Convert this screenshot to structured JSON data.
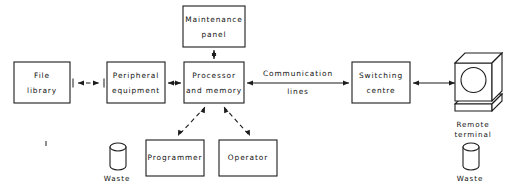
{
  "diagram": {
    "stroke_color": "#1c1c1c",
    "background_color": "#ffffff",
    "nodes": [
      {
        "id": "file-library",
        "label_line1": "File",
        "label_line2": "library",
        "x": 14,
        "y": 62,
        "w": 56,
        "h": 41
      },
      {
        "id": "peripheral-equipment",
        "label_line1": "Peripheral",
        "label_line2": "equipment",
        "x": 107,
        "y": 62,
        "w": 58,
        "h": 41
      },
      {
        "id": "processor-memory",
        "label_line1": "Processor",
        "label_line2": "and memory",
        "x": 184,
        "y": 62,
        "w": 60,
        "h": 41
      },
      {
        "id": "maintenance-panel",
        "label_line1": "Maintenance",
        "label_line2": "panel",
        "x": 183,
        "y": 6,
        "w": 62,
        "h": 41
      },
      {
        "id": "switching-centre",
        "label_line1": "Switching",
        "label_line2": "centre",
        "x": 352,
        "y": 62,
        "w": 58,
        "h": 41
      },
      {
        "id": "programmer",
        "label_line1": "Programmer",
        "label_line2": "",
        "x": 146,
        "y": 140,
        "w": 58,
        "h": 36
      },
      {
        "id": "operator",
        "label_line1": "Operator",
        "label_line2": "",
        "x": 219,
        "y": 140,
        "w": 58,
        "h": 36
      }
    ],
    "edge_labels": [
      {
        "id": "communication-lines",
        "line1": "Communication",
        "line2": "lines",
        "x": 298,
        "y": 74
      }
    ],
    "captions": [
      {
        "id": "remote-terminal-caption",
        "line1": "Remote",
        "line2": "terminal",
        "x": 473,
        "y": 126
      },
      {
        "id": "waste-left-caption",
        "line1": "Waste",
        "line2": "",
        "x": 117,
        "y": 179
      },
      {
        "id": "waste-right-caption",
        "line1": "Waste",
        "line2": "",
        "x": 470,
        "y": 179
      }
    ],
    "icons": [
      {
        "id": "remote-terminal",
        "name": "remote-terminal-icon",
        "x": 447,
        "y": 55
      },
      {
        "id": "waste-left",
        "name": "waste-bin-icon",
        "x": 110,
        "y": 142
      },
      {
        "id": "waste-right",
        "name": "waste-bin-icon",
        "x": 463,
        "y": 142
      }
    ],
    "connections": [
      {
        "id": "file-to-peripheral",
        "style": "dashed",
        "arrows": "both"
      },
      {
        "id": "peripheral-to-processor",
        "style": "solid",
        "arrows": "both"
      },
      {
        "id": "processor-to-maintenance",
        "style": "solid",
        "arrows": "both"
      },
      {
        "id": "processor-to-switching",
        "style": "solid",
        "arrows": "both"
      },
      {
        "id": "switching-to-terminal",
        "style": "solid",
        "arrows": "both"
      },
      {
        "id": "processor-to-programmer",
        "style": "dashed",
        "arrows": "both"
      },
      {
        "id": "processor-to-operator",
        "style": "dashed",
        "arrows": "both"
      }
    ]
  }
}
